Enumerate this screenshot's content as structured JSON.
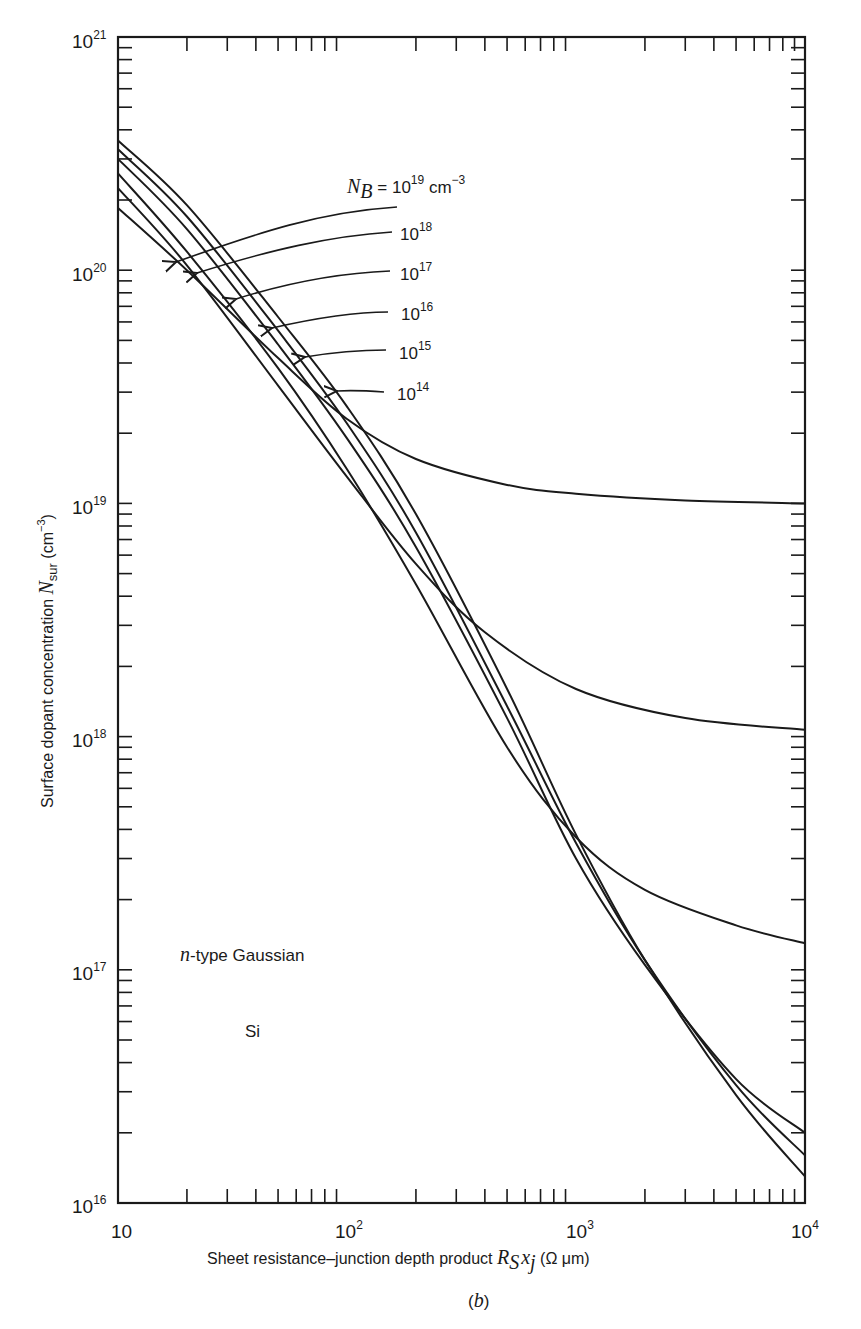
{
  "figure": {
    "panel_label": "(b)",
    "material": "Si",
    "profile_type": "n-type Gaussian"
  },
  "chart_data": {
    "type": "line",
    "title": "",
    "xlabel": "Sheet resistance–junction depth product R_S x_j (Ω μm)",
    "ylabel": "Surface dopant concentration N_sur (cm^-3)",
    "xscale": "log",
    "yscale": "log",
    "xlim": [
      10,
      10000
    ],
    "ylim": [
      1e+16,
      1e+21
    ],
    "x_ticks": [
      {
        "value": 10,
        "base": "10",
        "exp": ""
      },
      {
        "value": 100,
        "base": "10",
        "exp": "2"
      },
      {
        "value": 1000,
        "base": "10",
        "exp": "3"
      },
      {
        "value": 10000,
        "base": "10",
        "exp": "4"
      }
    ],
    "y_ticks": [
      {
        "value": 1e+16,
        "base": "10",
        "exp": "16"
      },
      {
        "value": 1e+17,
        "base": "10",
        "exp": "17"
      },
      {
        "value": 1e+18,
        "base": "10",
        "exp": "18"
      },
      {
        "value": 1e+19,
        "base": "10",
        "exp": "19"
      },
      {
        "value": 1e+20,
        "base": "10",
        "exp": "20"
      },
      {
        "value": 1e+21,
        "base": "10",
        "exp": "21"
      }
    ],
    "grid": false,
    "legend_title": "N_B = 10^19 cm^-3",
    "annotations": [
      "n-type Gaussian",
      "Si",
      "(b)"
    ],
    "series": [
      {
        "name": "N_B = 10^19 cm^-3",
        "label_base": "10",
        "label_exp": "19",
        "x": [
          10,
          20,
          50,
          100,
          200,
          500,
          1000,
          3000,
          10000
        ],
        "y": [
          1.85e+20,
          1e+20,
          4.2e+19,
          2.3e+19,
          1.55e+19,
          1.2e+19,
          1.1e+19,
          1.03e+19,
          1e+19
        ]
      },
      {
        "name": "N_B = 10^18 cm^-3",
        "label_base": "10",
        "label_exp": "18",
        "x": [
          10,
          20,
          50,
          100,
          200,
          400,
          1000,
          3000,
          10000
        ],
        "y": [
          2.25e+20,
          1.05e+20,
          3.2e+19,
          1.3e+19,
          5.5e+18,
          2.8e+18,
          1.6e+18,
          1.2e+18,
          1.07e+18
        ]
      },
      {
        "name": "N_B = 10^17 cm^-3",
        "label_base": "10",
        "label_exp": "17",
        "x": [
          10,
          20,
          50,
          100,
          200,
          500,
          1000,
          2000,
          5000,
          10000
        ],
        "y": [
          2.6e+20,
          1.2e+20,
          3.8e+19,
          1.4e+19,
          4.5e+18,
          9e+17,
          3.7e+17,
          2.2e+17,
          1.55e+17,
          1.3e+17
        ]
      },
      {
        "name": "N_B = 10^16 cm^-3",
        "label_base": "10",
        "label_exp": "16",
        "x": [
          10,
          20,
          50,
          100,
          200,
          500,
          1000,
          2000,
          5000,
          10000
        ],
        "y": [
          3e+20,
          1.5e+20,
          4.8e+19,
          1.9e+19,
          6.5e+18,
          1.2e+18,
          3e+17,
          1.05e+17,
          3.4e+16,
          2e+16
        ]
      },
      {
        "name": "N_B = 10^15 cm^-3",
        "label_base": "10",
        "label_exp": "15",
        "x": [
          10,
          20,
          50,
          100,
          200,
          500,
          1000,
          2000,
          5000,
          10000
        ],
        "y": [
          3.3e+20,
          1.7e+20,
          5.5e+19,
          2.2e+19,
          7.5e+18,
          1.35e+18,
          3.5e+17,
          1.1e+17,
          3.2e+16,
          1.6e+16
        ]
      },
      {
        "name": "N_B = 10^14 cm^-3",
        "label_base": "10",
        "label_exp": "14",
        "x": [
          10,
          20,
          50,
          100,
          200,
          500,
          1000,
          2000,
          5000,
          10000
        ],
        "y": [
          3.6e+20,
          1.9e+20,
          6.3e+19,
          2.6e+19,
          9e+18,
          1.6e+18,
          3.8e+17,
          1.1e+17,
          2.9e+16,
          1.3e+16
        ]
      }
    ]
  },
  "labels": {
    "nb_prefix": "N",
    "nb_sub": "B",
    "nb_eq": " = 10",
    "nb_exp": "19",
    "nb_unit": " cm",
    "nb_unit_exp": "−3",
    "l18_base": "10",
    "l18_exp": "18",
    "l17_base": "10",
    "l17_exp": "17",
    "l16_base": "10",
    "l16_exp": "16",
    "l15_base": "10",
    "l15_exp": "15",
    "l14_base": "10",
    "l14_exp": "14",
    "ann_n": "n",
    "ann_gauss": "-type Gaussian",
    "ann_si": "Si",
    "panel": "(",
    "panel_b": "b",
    "panel_close": ")",
    "xlabel_pre": "Sheet resistance–junction depth product ",
    "xlabel_R": "R",
    "xlabel_S": "S",
    "xlabel_x": "x",
    "xlabel_j": "j",
    "xlabel_unit": " (Ω μm)",
    "ylabel_pre": "Surface dopant concentration ",
    "ylabel_N": "N",
    "ylabel_sub": "sur",
    "ylabel_unit": " (cm",
    "ylabel_unit_exp": "−3",
    "ylabel_close": ")",
    "xt_10": "10",
    "xt_1e2": "10",
    "xt_1e2_exp": "2",
    "xt_1e3": "10",
    "xt_1e3_exp": "3",
    "xt_1e4": "10",
    "xt_1e4_exp": "4",
    "yt_base": "10",
    "yt_16": "16",
    "yt_17": "17",
    "yt_18": "18",
    "yt_19": "19",
    "yt_20": "20",
    "yt_21": "21"
  }
}
